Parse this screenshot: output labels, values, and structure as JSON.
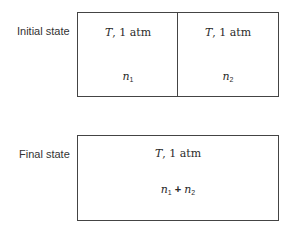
{
  "initial": {
    "label": "Initial state",
    "left": {
      "var": "T",
      "cond": ", 1 atm",
      "n": "n",
      "sub": "1"
    },
    "right": {
      "var": "T",
      "cond": ", 1 atm",
      "n": "n",
      "sub": "2"
    }
  },
  "final": {
    "label": "Final state",
    "var": "T",
    "cond": ", 1 atm",
    "n1": "n",
    "sub1": "1",
    "plus": " + ",
    "n2": "n",
    "sub2": "2"
  }
}
